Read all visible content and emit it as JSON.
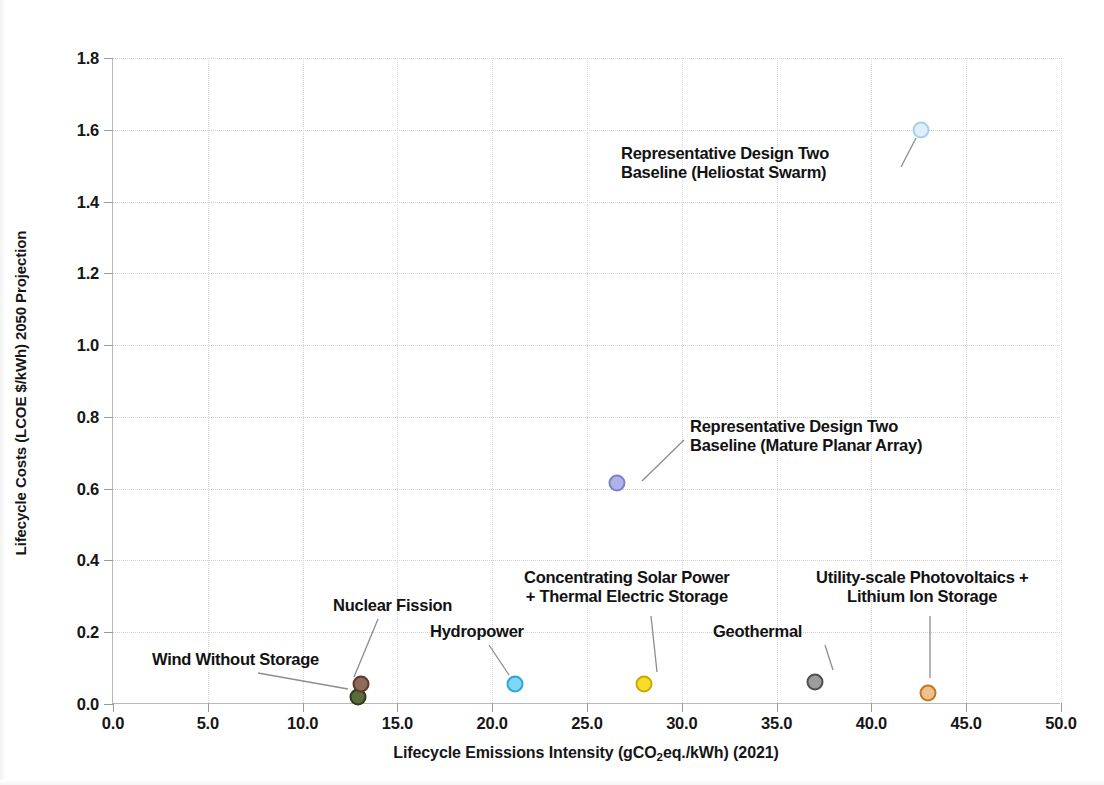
{
  "chart_data": {
    "type": "scatter",
    "title": "",
    "xlabel": "Lifecycle Emissions Intensity (gCO2eq./kWh) (2021)",
    "xlabel_parts": {
      "pre": "Lifecycle Emissions Intensity (gCO",
      "sub": "2",
      "post": "eq./kWh) (2021)"
    },
    "ylabel": "Lifecycle Costs (LCOE $/kWh) 2050 Projection",
    "xlim": [
      0.0,
      50.0
    ],
    "ylim": [
      0.0,
      1.8
    ],
    "xticks": [
      "0.0",
      "5.0",
      "10.0",
      "15.0",
      "20.0",
      "25.0",
      "30.0",
      "35.0",
      "40.0",
      "45.0",
      "50.0"
    ],
    "xtick_values": [
      0,
      5,
      10,
      15,
      20,
      25,
      30,
      35,
      40,
      45,
      50
    ],
    "yticks": [
      "0.0",
      "0.2",
      "0.4",
      "0.6",
      "0.8",
      "1.0",
      "1.2",
      "1.4",
      "1.6",
      "1.8"
    ],
    "ytick_values": [
      0.0,
      0.2,
      0.4,
      0.6,
      0.8,
      1.0,
      1.2,
      1.4,
      1.6,
      1.8
    ],
    "grid": "both-dotted",
    "legend": "none",
    "points": [
      {
        "label": "Wind Without Storage",
        "x": 12.9,
        "y": 0.02,
        "fill": "#5b6b3c",
        "stroke": "#2f3a1c",
        "radius_px": 17
      },
      {
        "label": "Nuclear Fission",
        "x": 13.1,
        "y": 0.055,
        "fill": "#8c6b5a",
        "stroke": "#5c3a2c",
        "radius_px": 17
      },
      {
        "label": "Hydropower",
        "x": 21.2,
        "y": 0.055,
        "fill": "#7fd7f5",
        "stroke": "#29a8d6",
        "radius_px": 17
      },
      {
        "label": "Concentrating Solar Power + Thermal Electric Storage",
        "x": 28.0,
        "y": 0.055,
        "fill": "#f5dd2a",
        "stroke": "#c9ab00",
        "radius_px": 17
      },
      {
        "label": "Geothermal",
        "x": 37.0,
        "y": 0.06,
        "fill": "#9c9c9c",
        "stroke": "#4f4f4f",
        "radius_px": 17
      },
      {
        "label": "Utility-scale Photovoltaics + Lithium Ion Storage",
        "x": 43.0,
        "y": 0.03,
        "fill": "#f0c08a",
        "stroke": "#c2762a",
        "radius_px": 17
      },
      {
        "label": "Representative Design Two Baseline (Mature Planar Array)",
        "x": 26.6,
        "y": 0.615,
        "fill": "#aeb4e6",
        "stroke": "#7a82cf",
        "radius_px": 17
      },
      {
        "label": "Representative Design Two Baseline (Heliostat Swarm)",
        "x": 42.6,
        "y": 1.6,
        "fill": "#dfeff9",
        "stroke": "#a9cfe6",
        "radius_px": 17
      }
    ],
    "annotations": [
      {
        "name": "wind-without-storage",
        "lines": [
          "Wind Without Storage"
        ],
        "align": "left",
        "text_left_px": 152,
        "text_top_px": 650,
        "leader": {
          "x1": 258,
          "y1": 673,
          "x2": 348,
          "y2": 689
        }
      },
      {
        "name": "nuclear-fission",
        "lines": [
          "Nuclear Fission"
        ],
        "align": "left",
        "text_left_px": 333,
        "text_top_px": 596,
        "leader": {
          "x1": 378,
          "y1": 619,
          "x2": 354,
          "y2": 677
        }
      },
      {
        "name": "hydropower",
        "lines": [
          "Hydropower"
        ],
        "align": "left",
        "text_left_px": 430,
        "text_top_px": 622,
        "leader": {
          "x1": 489,
          "y1": 645,
          "x2": 509,
          "y2": 675
        }
      },
      {
        "name": "concentrating-solar-power",
        "lines": [
          "Concentrating Solar Power",
          "+ Thermal Electric Storage"
        ],
        "align": "center",
        "text_left_px": 524,
        "text_top_px": 568,
        "leader": {
          "x1": 651,
          "y1": 616,
          "x2": 657,
          "y2": 672
        }
      },
      {
        "name": "utility-scale-photovoltaics",
        "lines": [
          "Utility-scale Photovoltaics +",
          "Lithium Ion Storage"
        ],
        "align": "center",
        "text_left_px": 816,
        "text_top_px": 568,
        "leader": {
          "x1": 930,
          "y1": 616,
          "x2": 930,
          "y2": 678
        }
      },
      {
        "name": "geothermal",
        "lines": [
          "Geothermal"
        ],
        "align": "left",
        "text_left_px": 713,
        "text_top_px": 622,
        "leader": {
          "x1": 825,
          "y1": 645,
          "x2": 833,
          "y2": 670
        }
      },
      {
        "name": "representative-design-two-mature-planar-array",
        "lines": [
          "Representative Design Two",
          "Baseline (Mature Planar Array)"
        ],
        "align": "left",
        "text_left_px": 690,
        "text_top_px": 417,
        "leader": {
          "x1": 684,
          "y1": 440,
          "x2": 642,
          "y2": 481
        }
      },
      {
        "name": "representative-design-two-heliostat-swarm",
        "lines": [
          "Representative Design Two",
          "Baseline (Heliostat Swarm)"
        ],
        "align": "left",
        "text_left_px": 621,
        "text_top_px": 144,
        "leader": {
          "x1": 901,
          "y1": 167,
          "x2": 916,
          "y2": 138
        }
      }
    ]
  }
}
